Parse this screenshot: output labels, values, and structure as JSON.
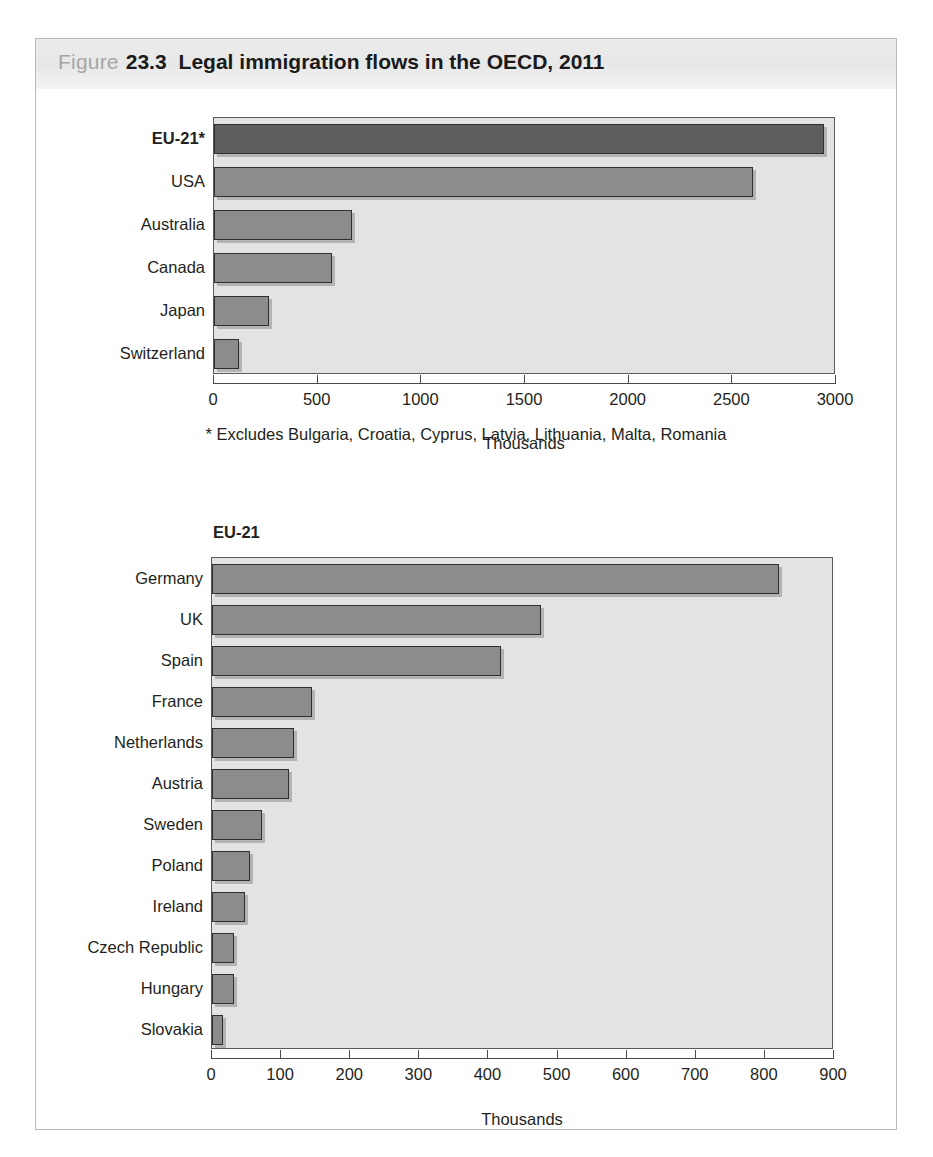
{
  "header": {
    "label": "Figure",
    "number": "23.3",
    "title": "Legal immigration flows in the OECD, 2011"
  },
  "footnote": "* Excludes Bulgaria, Croatia, Cyprus, Latvia, Lithuania, Malta, Romania",
  "chart_data": [
    {
      "type": "bar",
      "orientation": "horizontal",
      "id": "oecd-total",
      "title": "",
      "xlabel": "Thousands",
      "ylabel": "",
      "xlim": [
        0,
        3000
      ],
      "xticks": [
        0,
        500,
        1000,
        1500,
        2000,
        2500,
        3000
      ],
      "tick_labels": [
        "0",
        "500",
        "1000",
        "1500",
        "2000",
        "2500",
        "3000"
      ],
      "grid": false,
      "legend": "none",
      "categories": [
        "EU-21*",
        "USA",
        "Australia",
        "Canada",
        "Japan",
        "Switzerland"
      ],
      "values": [
        2940,
        2600,
        665,
        570,
        265,
        120
      ],
      "highlight_index": 0,
      "bold_labels": [
        "EU-21*"
      ]
    },
    {
      "type": "bar",
      "orientation": "horizontal",
      "id": "eu-21-detail",
      "title": "EU-21",
      "xlabel": "Thousands",
      "ylabel": "",
      "xlim": [
        0,
        900
      ],
      "xticks": [
        0,
        100,
        200,
        300,
        400,
        500,
        600,
        700,
        800,
        900
      ],
      "tick_labels": [
        "0",
        "100",
        "200",
        "300",
        "400",
        "500",
        "600",
        "700",
        "800",
        "900"
      ],
      "grid": false,
      "legend": "none",
      "categories": [
        "Germany",
        "UK",
        "Spain",
        "France",
        "Netherlands",
        "Austria",
        "Sweden",
        "Poland",
        "Ireland",
        "Czech Republic",
        "Hungary",
        "Slovakia"
      ],
      "values": [
        820,
        476,
        418,
        145,
        119,
        112,
        72,
        55,
        48,
        32,
        32,
        16
      ],
      "highlight_index": -1,
      "bold_labels": []
    }
  ],
  "colors": {
    "bar": "#8c8c8c",
    "bar_highlight": "#5e5e5e",
    "plot_background": "#e3e3e3",
    "header_background": "#e8e8e8",
    "frame_border": "#b9b9b9",
    "text": "#231f20"
  }
}
